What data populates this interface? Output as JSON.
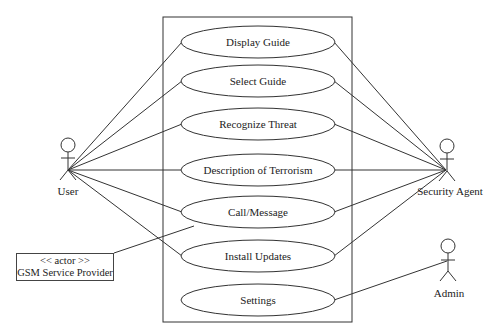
{
  "diagram": {
    "type": "use-case",
    "system_boundary": true,
    "use_cases": [
      {
        "label": "Display Guide",
        "cx": 258,
        "cy": 42
      },
      {
        "label": "Select Guide",
        "cx": 258,
        "cy": 81
      },
      {
        "label": "Recognize Threat",
        "cx": 258,
        "cy": 124
      },
      {
        "label": "Description of Terrorism",
        "cx": 258,
        "cy": 170
      },
      {
        "label": "Call/Message",
        "cx": 258,
        "cy": 212
      },
      {
        "label": "Install Updates",
        "cx": 258,
        "cy": 256
      },
      {
        "label": "Settings",
        "cx": 258,
        "cy": 300
      }
    ],
    "actors": {
      "user": {
        "label": "User"
      },
      "security_agent": {
        "label": "Security Agent"
      },
      "admin": {
        "label": "Admin"
      },
      "gsm": {
        "stereotype": "<< actor >>",
        "label": "GSM Service Provider"
      }
    },
    "associations": [
      {
        "from": "User",
        "to": "Display Guide"
      },
      {
        "from": "User",
        "to": "Select Guide"
      },
      {
        "from": "User",
        "to": "Recognize Threat"
      },
      {
        "from": "User",
        "to": "Description of Terrorism"
      },
      {
        "from": "User",
        "to": "Call/Message"
      },
      {
        "from": "User",
        "to": "Install Updates"
      },
      {
        "from": "GSM Service Provider",
        "to": "Call/Message"
      },
      {
        "from": "Security Agent",
        "to": "Display Guide"
      },
      {
        "from": "Security Agent",
        "to": "Select Guide"
      },
      {
        "from": "Security Agent",
        "to": "Recognize Threat"
      },
      {
        "from": "Security Agent",
        "to": "Description of Terrorism"
      },
      {
        "from": "Security Agent",
        "to": "Call/Message"
      },
      {
        "from": "Security Agent",
        "to": "Install Updates"
      },
      {
        "from": "Admin",
        "to": "Settings"
      }
    ]
  }
}
